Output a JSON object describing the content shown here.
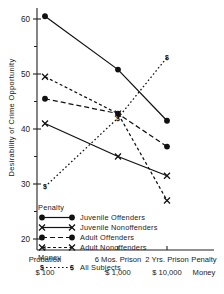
{
  "chart_data": {
    "type": "line",
    "title": "",
    "xlabel": "Penalty",
    "ylabel": "Desirability of Crime Opportunity",
    "ylim": [
      18,
      62
    ],
    "yticks": [
      20,
      30,
      40,
      50,
      60
    ],
    "yminorticks": [
      25,
      35,
      45,
      55
    ],
    "grid": false,
    "legend_position": "lower-left-inside",
    "categories": [
      "Probation",
      "6 Mos. Prison",
      "2 Yrs. Prison"
    ],
    "x_secondary_categories": [
      "$ 100",
      "$ 1,000",
      "$ 10,000"
    ],
    "x_axis_row_labels": [
      "Penalty",
      "Money"
    ],
    "legend_groups": [
      {
        "heading": "Penalty",
        "entries": [
          {
            "label": "Juvenile Offenders",
            "marker": "filled-circle",
            "line": "solid"
          },
          {
            "label": "Juvenile Nonoffenders",
            "marker": "x-cross",
            "line": "solid"
          },
          {
            "label": "Adult Offenders",
            "marker": "filled-circle",
            "line": "dashed"
          },
          {
            "label": "Adult Nonoffenders",
            "marker": "x-cross",
            "line": "dotted-dashed"
          }
        ]
      },
      {
        "heading": "Money",
        "entries": [
          {
            "label": "All Subjects",
            "marker": "dollar-sign",
            "line": "dotted"
          }
        ]
      }
    ],
    "series": [
      {
        "name": "Juvenile Offenders",
        "group": "Penalty",
        "marker": "filled-circle",
        "line": "solid",
        "values": [
          60.5,
          50.8,
          41.5
        ]
      },
      {
        "name": "Juvenile Nonoffenders",
        "group": "Penalty",
        "marker": "x-cross",
        "line": "solid",
        "values": [
          41.0,
          35.0,
          31.5
        ]
      },
      {
        "name": "Adult Offenders",
        "group": "Penalty",
        "marker": "filled-circle",
        "line": "dashed",
        "values": [
          45.5,
          42.8,
          36.8
        ]
      },
      {
        "name": "Adult Nonoffenders",
        "group": "Penalty",
        "marker": "x-cross",
        "line": "dotted-dashed",
        "values": [
          49.5,
          42.8,
          27.0
        ]
      },
      {
        "name": "All Subjects",
        "group": "Money",
        "marker": "dollar-sign",
        "line": "dotted",
        "values": [
          29.5,
          42.0,
          53.0
        ]
      }
    ]
  }
}
